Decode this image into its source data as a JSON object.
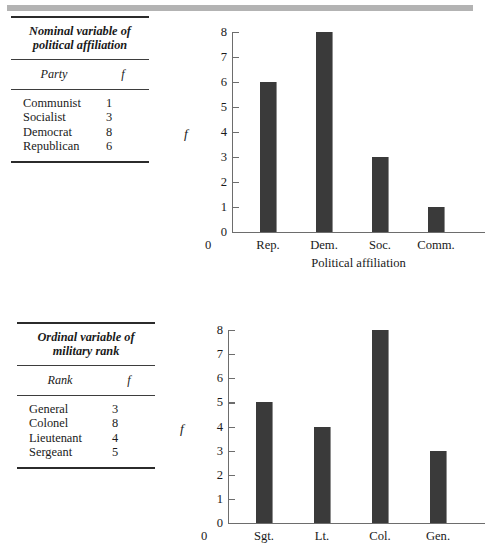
{
  "page": {
    "background": "#ffffff",
    "rule_color": "#2b2b2b",
    "bar_color": "#3a3a3a",
    "axis_color": "#6d6d6d",
    "top_bar_color": "#b3b3b3"
  },
  "tables": [
    {
      "id": "political",
      "caption_line1": "Nominal variable of",
      "caption_line2": "political affiliation",
      "columns": [
        "Party",
        "f"
      ],
      "rows": [
        {
          "label": "Communist",
          "f": "1"
        },
        {
          "label": "Socialist",
          "f": "3"
        },
        {
          "label": "Democrat",
          "f": "8"
        },
        {
          "label": "Republican",
          "f": "6"
        }
      ]
    },
    {
      "id": "military",
      "caption_line1": "Ordinal variable of",
      "caption_line2": "military rank",
      "columns": [
        "Rank",
        "f"
      ],
      "rows": [
        {
          "label": "General",
          "f": "3"
        },
        {
          "label": "Colonel",
          "f": "8"
        },
        {
          "label": "Lieutenant",
          "f": "4"
        },
        {
          "label": "Sergeant",
          "f": "5"
        }
      ]
    }
  ],
  "chart_data": [
    {
      "type": "bar",
      "id": "political-affiliation-bar-chart",
      "title": "",
      "categories": [
        "Rep.",
        "Dem.",
        "Soc.",
        "Comm."
      ],
      "values": [
        6,
        8,
        3,
        1
      ],
      "xlabel": "Political affiliation",
      "ylabel": "f",
      "ylim": [
        0,
        8
      ],
      "yticks": [
        0,
        1,
        2,
        3,
        4,
        5,
        6,
        7,
        8
      ],
      "ytick_labels": [
        "0",
        "1",
        "2",
        "3",
        "4",
        "5",
        "6",
        "7",
        "8"
      ],
      "grid": false,
      "legend": false
    },
    {
      "type": "bar",
      "id": "military-rank-bar-chart",
      "title": "",
      "categories": [
        "Sgt.",
        "Lt.",
        "Col.",
        "Gen."
      ],
      "values": [
        5,
        4,
        8,
        3
      ],
      "xlabel": "",
      "ylabel": "f",
      "ylim": [
        0,
        8
      ],
      "yticks": [
        0,
        1,
        2,
        3,
        4,
        5,
        6,
        7,
        8
      ],
      "ytick_labels": [
        "0",
        "1",
        "2",
        "3",
        "4",
        "5",
        "6",
        "7",
        "8"
      ],
      "grid": false,
      "legend": false
    }
  ]
}
